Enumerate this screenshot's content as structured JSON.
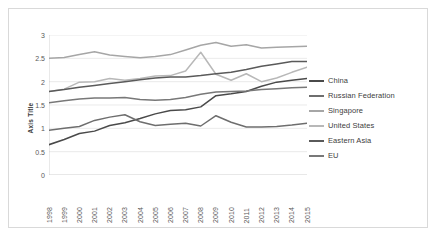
{
  "chart_data": {
    "type": "line",
    "title": "",
    "xlabel": "",
    "ylabel": "Axis Title",
    "ylim": [
      0,
      3
    ],
    "yticks": [
      0,
      0.5,
      1,
      1.5,
      2,
      2.5,
      3
    ],
    "ytick_labels": [
      "0",
      "0.5",
      "1",
      "1.5",
      "2",
      "2.5",
      "3"
    ],
    "grid": true,
    "legend_position": "right",
    "categories": [
      "1998",
      "1999",
      "2000",
      "2001",
      "2002",
      "2003",
      "2004",
      "2005",
      "2006",
      "2007",
      "2008",
      "2009",
      "2010",
      "2011",
      "2012",
      "2013",
      "2014",
      "2015"
    ],
    "series": [
      {
        "name": "China",
        "color": "#4a4a4a",
        "values": [
          0.65,
          0.76,
          0.89,
          0.94,
          1.06,
          1.12,
          1.21,
          1.31,
          1.38,
          1.4,
          1.46,
          1.7,
          1.74,
          1.79,
          1.9,
          1.99,
          2.03,
          2.07
        ]
      },
      {
        "name": "Russian Federation",
        "color": "#6e6e6e",
        "values": [
          0.96,
          1.0,
          1.04,
          1.17,
          1.24,
          1.29,
          1.14,
          1.06,
          1.09,
          1.11,
          1.05,
          1.27,
          1.13,
          1.03,
          1.03,
          1.04,
          1.07,
          1.11
        ]
      },
      {
        "name": "Singapore",
        "color": "#a6a6a6",
        "values": [
          2.5,
          2.52,
          2.58,
          2.64,
          2.57,
          2.54,
          2.51,
          2.54,
          2.58,
          2.68,
          2.78,
          2.84,
          2.76,
          2.79,
          2.72,
          2.74,
          2.75,
          2.76
        ]
      },
      {
        "name": "United States",
        "color": "#b8b8b8",
        "values": [
          1.79,
          1.84,
          1.99,
          2.0,
          2.07,
          2.03,
          2.07,
          2.12,
          2.13,
          2.23,
          2.63,
          2.16,
          2.03,
          2.17,
          2.0,
          2.08,
          2.2,
          2.31
        ]
      },
      {
        "name": "Eastern Asia",
        "color": "#5a5a5a",
        "values": [
          1.79,
          1.83,
          1.88,
          1.92,
          1.96,
          2.0,
          2.04,
          2.08,
          2.1,
          2.1,
          2.13,
          2.17,
          2.2,
          2.26,
          2.33,
          2.38,
          2.43,
          2.43
        ]
      },
      {
        "name": "EU",
        "color": "#787878",
        "values": [
          1.55,
          1.59,
          1.63,
          1.65,
          1.65,
          1.66,
          1.62,
          1.6,
          1.62,
          1.66,
          1.73,
          1.78,
          1.79,
          1.8,
          1.83,
          1.85,
          1.87,
          1.88
        ]
      }
    ]
  },
  "legend": {
    "items": [
      {
        "label": "China"
      },
      {
        "label": "Russian Federation"
      },
      {
        "label": "Singapore"
      },
      {
        "label": "United States"
      },
      {
        "label": "Eastern Asia"
      },
      {
        "label": "EU"
      }
    ]
  }
}
